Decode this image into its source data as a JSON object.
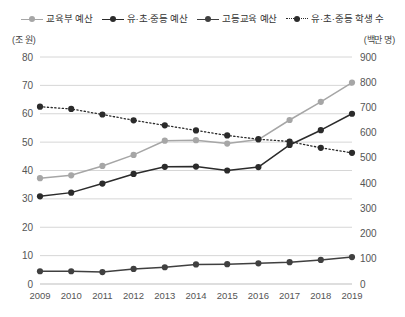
{
  "chart_data": {
    "type": "line",
    "title": "",
    "xlabel": "",
    "ylabel": "조 원",
    "y2label": "백만 명",
    "grid": true,
    "legend_position": "top",
    "categories": [
      "2009",
      "2010",
      "2011",
      "2012",
      "2013",
      "2014",
      "2015",
      "2016",
      "2017",
      "2018",
      "2019"
    ],
    "ylim": [
      0,
      80
    ],
    "yticks": [
      0,
      10,
      20,
      30,
      40,
      50,
      60,
      70,
      80
    ],
    "y2lim": [
      0,
      900
    ],
    "y2ticks": [
      0,
      100,
      200,
      300,
      400,
      500,
      600,
      700,
      800,
      900
    ],
    "series": [
      {
        "name": "교육부 예산",
        "axis": "left",
        "color": "#a6a6a6",
        "style": "solid",
        "values": [
          37.3,
          38.3,
          41.6,
          45.5,
          50.5,
          50.7,
          49.5,
          50.9,
          57.8,
          64.2,
          71.0
        ]
      },
      {
        "name": "유·초·중등 예산",
        "axis": "left",
        "color": "#2b2b2b",
        "style": "solid",
        "values": [
          30.9,
          32.2,
          35.4,
          38.8,
          41.3,
          41.4,
          40.0,
          41.2,
          49.0,
          54.2,
          60.0
        ]
      },
      {
        "name": "고등교육 예산",
        "axis": "left",
        "color": "#404040",
        "style": "solid",
        "values": [
          4.5,
          4.5,
          4.2,
          5.3,
          5.9,
          6.9,
          7.0,
          7.3,
          7.7,
          8.5,
          9.5
        ]
      },
      {
        "name": "유·초·중등 학생 수",
        "axis": "right",
        "color": "#2b2b2b",
        "style": "dotted",
        "values": [
          703,
          694,
          672,
          649,
          629,
          609,
          589,
          574,
          565,
          540,
          520
        ]
      }
    ]
  },
  "legend": {
    "items": [
      {
        "label": "교육부 예산"
      },
      {
        "label": "유·초·중등 예산"
      },
      {
        "label": "고등교육 예산"
      },
      {
        "label": "유·초·중등 학생 수"
      }
    ]
  },
  "axes": {
    "left_unit": "(조 원)",
    "right_unit": "(백만 명)"
  }
}
